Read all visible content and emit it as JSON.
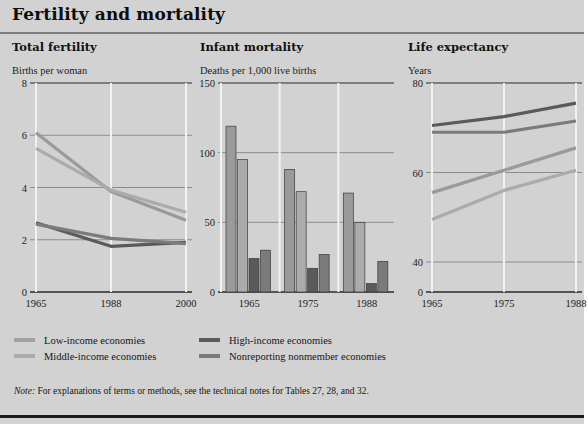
{
  "figure": {
    "title": "Fertility and mortality",
    "note_prefix": "Note:",
    "note_text": " For explanations of terms or methods, see the technical notes for Tables 27, 28, and 32."
  },
  "colors": {
    "background": "#d2d2d2",
    "plot_background": "#d2d2d2",
    "gridline": "#8d8d8d",
    "axis": "#2a2a2a",
    "tick_divider": "#f2f2f2",
    "low_income": "#9a9a9a",
    "middle_income": "#ababab",
    "high_income": "#5a5a5a",
    "nonreporting": "#7b7b7b",
    "title_rule": "#7d7d7d",
    "bottom_rule": "#1a1a1a"
  },
  "legend": {
    "items": [
      {
        "label": "Low-income economies",
        "color": "#a2a2a2",
        "column": 0,
        "row": 0
      },
      {
        "label": "Middle-income economies",
        "color": "#ababab",
        "column": 0,
        "row": 1
      },
      {
        "label": "High-income economies",
        "color": "#5a5a5a",
        "column": 1,
        "row": 0
      },
      {
        "label": "Nonreporting nonmember economies",
        "color": "#7b7b7b",
        "column": 1,
        "row": 1
      }
    ]
  },
  "chart_data": [
    {
      "id": "total-fertility",
      "type": "line",
      "title": "Total fertility",
      "ylabel": "Births per woman",
      "xlabel": "",
      "x": [
        1965,
        1988,
        2000
      ],
      "xticklabels": [
        "1965",
        "1988",
        "2000"
      ],
      "yticks": [
        0,
        2,
        4,
        6,
        8
      ],
      "yticklabels": [
        "0",
        "2",
        "4",
        "6",
        "8"
      ],
      "ylim": [
        0,
        8
      ],
      "grid": true,
      "legend_position": "below-figure",
      "series": [
        {
          "name": "Low-income economies",
          "color": "#9a9a9a",
          "values": [
            6.1,
            3.85,
            2.75
          ]
        },
        {
          "name": "Middle-income economies",
          "color": "#ababab",
          "values": [
            5.5,
            3.9,
            3.05
          ]
        },
        {
          "name": "High-income economies",
          "color": "#5a5a5a",
          "values": [
            2.65,
            1.75,
            1.9
          ]
        },
        {
          "name": "Nonreporting nonmember economies",
          "color": "#7b7b7b",
          "values": [
            2.6,
            2.05,
            1.85
          ]
        }
      ]
    },
    {
      "id": "infant-mortality",
      "type": "bar",
      "title": "Infant mortality",
      "ylabel": "Deaths per 1,000 live births",
      "xlabel": "",
      "categories": [
        "1965",
        "1975",
        "1988"
      ],
      "yticks": [
        0,
        50,
        100,
        150
      ],
      "yticklabels": [
        "0",
        "50",
        "100",
        "150"
      ],
      "ylim": [
        0,
        150
      ],
      "grid": true,
      "series": [
        {
          "name": "Low-income economies",
          "color": "#9a9a9a",
          "values": [
            119,
            88,
            71
          ]
        },
        {
          "name": "Middle-income economies",
          "color": "#ababab",
          "values": [
            95,
            72,
            50
          ]
        },
        {
          "name": "High-income economies",
          "color": "#5a5a5a",
          "values": [
            24,
            17,
            6
          ]
        },
        {
          "name": "Nonreporting nonmember economies",
          "color": "#7b7b7b",
          "values": [
            30,
            27,
            22
          ]
        }
      ]
    },
    {
      "id": "life-expectancy",
      "type": "line",
      "title": "Life expectancy",
      "ylabel": "Years",
      "xlabel": "",
      "x": [
        1965,
        1975,
        1988
      ],
      "xticklabels": [
        "1965",
        "1975",
        "1988"
      ],
      "yticks": [
        0,
        40,
        60,
        80
      ],
      "yticklabels": [
        "0",
        "40",
        "60",
        "80"
      ],
      "ylim": [
        0,
        80
      ],
      "axis_break": true,
      "grid": true,
      "series": [
        {
          "name": "Low-income economies",
          "color": "#9a9a9a",
          "values": [
            55.5,
            60.5,
            65.5
          ]
        },
        {
          "name": "Middle-income economies",
          "color": "#ababab",
          "values": [
            49.5,
            56.0,
            60.5
          ]
        },
        {
          "name": "High-income economies",
          "color": "#5a5a5a",
          "values": [
            70.5,
            72.5,
            75.5
          ]
        },
        {
          "name": "Nonreporting nonmember economies",
          "color": "#7b7b7b",
          "values": [
            69.0,
            69.0,
            71.5
          ]
        }
      ]
    }
  ]
}
